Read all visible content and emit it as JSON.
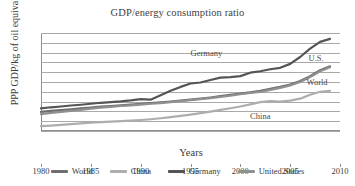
{
  "chart_data": {
    "type": "line",
    "title": "GDP/energy consumption ratio",
    "xlabel": "Years",
    "ylabel": "PPP GDP/kg of oil equivalent",
    "xlim": [
      1980,
      2010
    ],
    "ylim": [
      0,
      10
    ],
    "grid": true,
    "legend_position": "bottom",
    "xticks": [
      "1980",
      "1985",
      "1990",
      "1995",
      "2000",
      "2005",
      "2010"
    ],
    "yticks": [
      "0",
      "1",
      "2",
      "3",
      "4",
      "5",
      "6",
      "7",
      "8",
      "9",
      "10"
    ],
    "x": [
      1980,
      1981,
      1982,
      1983,
      1984,
      1985,
      1986,
      1987,
      1988,
      1989,
      1990,
      1991,
      1992,
      1993,
      1994,
      1995,
      1996,
      1997,
      1998,
      1999,
      2000,
      2001,
      2002,
      2003,
      2004,
      2005,
      2006,
      2007,
      2008,
      2009
    ],
    "series": [
      {
        "name": "World",
        "color": "#6e6e6e",
        "values": [
          1.95,
          2.05,
          2.12,
          2.2,
          2.3,
          2.4,
          2.48,
          2.55,
          2.62,
          2.7,
          2.78,
          2.85,
          2.92,
          3.0,
          3.1,
          3.2,
          3.3,
          3.42,
          3.55,
          3.68,
          3.82,
          3.95,
          4.1,
          4.3,
          4.5,
          4.75,
          5.1,
          5.6,
          6.2,
          6.6
        ]
      },
      {
        "name": "China",
        "color": "#adadad",
        "values": [
          0.5,
          0.55,
          0.62,
          0.7,
          0.78,
          0.85,
          0.9,
          0.95,
          1.0,
          1.05,
          1.12,
          1.2,
          1.3,
          1.42,
          1.55,
          1.68,
          1.82,
          1.98,
          2.15,
          2.32,
          2.5,
          2.72,
          2.95,
          3.05,
          3.0,
          3.1,
          3.3,
          3.7,
          4.0,
          4.1
        ]
      },
      {
        "name": "Germany",
        "color": "#555555",
        "values": [
          2.3,
          2.42,
          2.5,
          2.6,
          2.68,
          2.78,
          2.88,
          2.95,
          3.02,
          3.12,
          3.25,
          3.2,
          3.65,
          4.1,
          4.5,
          4.85,
          4.95,
          5.2,
          5.45,
          5.5,
          5.6,
          5.95,
          6.1,
          6.3,
          6.45,
          6.85,
          7.55,
          8.4,
          9.1,
          9.4
        ]
      },
      {
        "name": "United States",
        "color": "#909090",
        "values": [
          1.72,
          1.85,
          1.95,
          2.05,
          2.15,
          2.28,
          2.38,
          2.46,
          2.55,
          2.62,
          2.7,
          2.78,
          2.85,
          2.95,
          3.05,
          3.15,
          3.25,
          3.35,
          3.48,
          3.6,
          3.75,
          3.88,
          4.0,
          4.2,
          4.4,
          4.65,
          5.0,
          5.5,
          6.1,
          6.5
        ]
      }
    ],
    "annotations": [
      {
        "text": "Germany",
        "x": 1996.6,
        "y": 8.0
      },
      {
        "text": "U.S.",
        "x": 2007.6,
        "y": 7.5
      },
      {
        "text": "World",
        "x": 2007.7,
        "y": 5.0
      },
      {
        "text": "China",
        "x": 2002.0,
        "y": 1.5
      }
    ],
    "legend": [
      {
        "label": "World",
        "color": "#6e6e6e"
      },
      {
        "label": "China",
        "color": "#adadad"
      },
      {
        "label": "Germany",
        "color": "#555555"
      },
      {
        "label": "United States",
        "color": "#909090"
      }
    ]
  }
}
